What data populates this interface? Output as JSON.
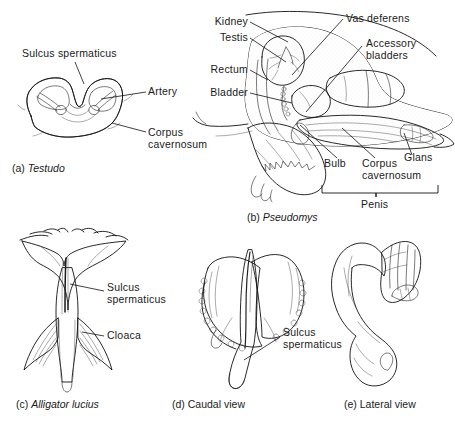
{
  "figure": {
    "background_color": "#ffffff",
    "ink_color": "#111111",
    "style": "black-and-white stippled line drawing"
  },
  "panels": [
    {
      "key": "a",
      "caption_prefix": "(a)",
      "caption_name": "Testudo",
      "caption_italic": true,
      "view": "transverse section of penis",
      "labels": [
        {
          "name": "sulcus-spermaticus",
          "text": "Sulcus spermaticus"
        },
        {
          "name": "artery",
          "text": "Artery"
        },
        {
          "name": "corpus-cavernosum",
          "text": "Corpus\ncavernosum"
        }
      ]
    },
    {
      "key": "b",
      "caption_prefix": "(b)",
      "caption_name": "Pseudomys",
      "caption_italic": true,
      "view": "sagittal dissection of male urogenital tract",
      "labels": [
        {
          "name": "kidney",
          "text": "Kidney"
        },
        {
          "name": "testis",
          "text": "Testis"
        },
        {
          "name": "rectum",
          "text": "Rectum"
        },
        {
          "name": "bladder",
          "text": "Bladder"
        },
        {
          "name": "vas-deferens",
          "text": "Vas deferens"
        },
        {
          "name": "accessory-bladders",
          "text": "Accessory\nbladders"
        },
        {
          "name": "bulb",
          "text": "Bulb"
        },
        {
          "name": "corpus-cavernosum",
          "text": "Corpus\ncavernosum"
        },
        {
          "name": "glans",
          "text": "Glans"
        },
        {
          "name": "penis-bracket",
          "text": "Penis"
        }
      ]
    },
    {
      "key": "c",
      "caption_prefix": "(c)",
      "caption_name": "Alligator lucius",
      "caption_italic": true,
      "view": "ventral view of phallus and cloaca",
      "labels": [
        {
          "name": "sulcus-spermaticus",
          "text": "Sulcus\nspermaticus"
        },
        {
          "name": "cloaca",
          "text": "Cloaca"
        }
      ]
    },
    {
      "key": "d",
      "caption_prefix": "(d)",
      "caption_name": "Caudal view",
      "caption_italic": false,
      "view": "caudal view of phallus",
      "labels": [
        {
          "name": "sulcus-spermaticus",
          "text": "Sulcus\nspermaticus"
        }
      ]
    },
    {
      "key": "e",
      "caption_prefix": "(e)",
      "caption_name": "Lateral view",
      "caption_italic": false,
      "view": "lateral view of phallus",
      "labels": []
    }
  ],
  "text": {
    "a_sulcus": "Sulcus spermaticus",
    "a_artery": "Artery",
    "a_corpus_1": "Corpus",
    "a_corpus_2": "cavernosum",
    "a_caption_prefix": "(a)",
    "a_caption_name": "Testudo",
    "b_kidney": "Kidney",
    "b_testis": "Testis",
    "b_rectum": "Rectum",
    "b_bladder": "Bladder",
    "b_vas_deferens": "Vas deferens",
    "b_accessory_1": "Accessory",
    "b_accessory_2": "bladders",
    "b_bulb": "Bulb",
    "b_corpus_1": "Corpus",
    "b_corpus_2": "cavernosum",
    "b_glans": "Glans",
    "b_penis": "Penis",
    "b_caption_prefix": "(b)",
    "b_caption_name": "Pseudomys",
    "c_sulcus_1": "Sulcus",
    "c_sulcus_2": "spermaticus",
    "c_cloaca": "Cloaca",
    "c_caption_prefix": "(c)",
    "c_caption_name": "Alligator lucius",
    "d_sulcus_1": "Sulcus",
    "d_sulcus_2": "spermaticus",
    "d_caption_prefix": "(d)",
    "d_caption_name": "Caudal view",
    "e_caption_prefix": "(e)",
    "e_caption_name": "Lateral view"
  }
}
